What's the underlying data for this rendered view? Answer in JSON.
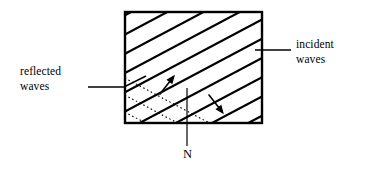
{
  "figure": {
    "type": "physics-diagram",
    "background_color": "#ffffff",
    "stroke_color": "#000000",
    "box": {
      "name": "medium-boundary-box",
      "left": 125,
      "top": 12,
      "right": 262,
      "bottom": 123,
      "border_width": 2.4
    },
    "hatching": {
      "name": "incident-wavefront-hatching",
      "style": "solid",
      "line_width": 2.2,
      "direction": "lower-left-to-upper-right",
      "angle_degrees": 28,
      "count": 9,
      "spacing_px": 17
    },
    "dotted_lines": {
      "name": "reflected-wavefront-dotted",
      "style": "dotted",
      "line_width": 1.1,
      "direction": "upper-left-to-lower-right",
      "angle_degrees": -28,
      "count": 3,
      "spacing_px": 17
    },
    "arrows": [
      {
        "name": "reflected-wave-direction-arrow",
        "direction": "up-right",
        "x1": 160,
        "y1": 94,
        "x2": 174,
        "y2": 76
      },
      {
        "name": "incident-wave-direction-arrow",
        "direction": "down-right",
        "x1": 209,
        "y1": 95,
        "x2": 223,
        "y2": 113
      }
    ],
    "normal_line": {
      "name": "normal-line-N",
      "x": 187,
      "y_top": 88,
      "y_bottom": 146
    }
  },
  "labels": {
    "incident": {
      "name": "incident-waves-label",
      "line1": "incident",
      "line2": "waves",
      "text_x": 296,
      "text_y1": 48,
      "text_y2": 63,
      "leader": {
        "x1": 255,
        "y1": 50,
        "x2": 291,
        "y2": 50
      }
    },
    "reflected": {
      "name": "reflected-waves-label",
      "line1": "reflected",
      "line2": "waves",
      "text_x": 20,
      "text_y1": 75,
      "text_y2": 90,
      "leader_h": {
        "x1": 88,
        "y1": 87,
        "x2": 124,
        "y2": 87
      },
      "leader_d": {
        "x1": 124,
        "y1": 87,
        "x2": 146,
        "y2": 76
      }
    },
    "normal": {
      "name": "normal-label",
      "text": "N",
      "text_x": 183,
      "text_y": 158
    }
  }
}
